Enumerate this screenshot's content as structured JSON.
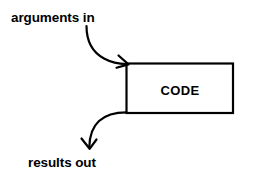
{
  "diagram": {
    "background_color": "#ffffff",
    "stroke_color": "#000000",
    "box": {
      "label": "CODE",
      "x": 126,
      "y": 63,
      "width": 107,
      "height": 50
    },
    "labels": {
      "input": "arguments in",
      "output": "results out"
    },
    "arrows": [
      {
        "name": "arguments-in-arrow",
        "from": "arguments in label",
        "to": "CODE box top-left",
        "direction": "down-right"
      },
      {
        "name": "results-out-arrow",
        "from": "CODE box bottom-left",
        "to": "results out label",
        "direction": "down-left"
      }
    ]
  }
}
